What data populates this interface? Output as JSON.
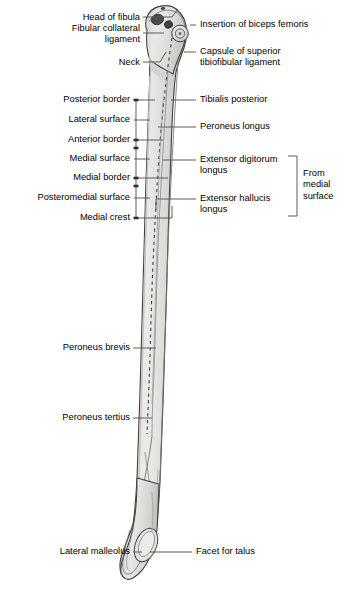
{
  "figure": {
    "title": "Fibula",
    "view": "lateral",
    "colors": {
      "background": "#ffffff",
      "bone_fill_light": "#e8e7e4",
      "bone_fill_mid": "#d6d5d2",
      "bone_fill_shadow": "#bfbebb",
      "bone_outline": "#3a3a3a",
      "marking_dark": "#4a4a4a",
      "leader_line": "#555555",
      "text": "#000000"
    }
  },
  "labels_left": [
    {
      "id": "head-of-fibula",
      "text": "Head of fibula",
      "x": 30,
      "y": 17,
      "width": 110
    },
    {
      "id": "fibular-collateral-ligament",
      "text": "Fibular collateral\nligament",
      "x": 18,
      "y": 28,
      "width": 122
    },
    {
      "id": "neck",
      "text": "Neck",
      "x": 70,
      "y": 58,
      "width": 70
    },
    {
      "id": "posterior-border",
      "text": "Posterior border",
      "x": 22,
      "y": 95,
      "width": 108
    },
    {
      "id": "lateral-surface",
      "text": "Lateral surface",
      "x": 26,
      "y": 115,
      "width": 104
    },
    {
      "id": "anterior-border",
      "text": "Anterior border",
      "x": 25,
      "y": 135,
      "width": 105
    },
    {
      "id": "medial-surface",
      "text": "Medial surface",
      "x": 26,
      "y": 155,
      "width": 104
    },
    {
      "id": "medial-border",
      "text": "Medial border",
      "x": 30,
      "y": 174,
      "width": 100
    },
    {
      "id": "posteromedial-surface",
      "text": "Posteromedial surface",
      "x": 5,
      "y": 193,
      "width": 125
    },
    {
      "id": "medial-crest",
      "text": "Medial crest",
      "x": 38,
      "y": 213,
      "width": 92
    },
    {
      "id": "peroneus-brevis",
      "text": "Peroneus brevis",
      "x": 24,
      "y": 343,
      "width": 106
    },
    {
      "id": "peroneus-tertius",
      "text": "Peroneus tertius",
      "x": 22,
      "y": 413,
      "width": 108
    },
    {
      "id": "lateral-malleolus",
      "text": "Lateral malleolus",
      "x": 20,
      "y": 546,
      "width": 110
    }
  ],
  "labels_right": [
    {
      "id": "insertion-of-biceps-femoris",
      "text": "Insertion of biceps femoris",
      "x": 200,
      "y": 20,
      "width": 142
    },
    {
      "id": "capsule-of-superior-tibiofibular-ligament",
      "text": "Capsule of superior\ntibiofibular ligament",
      "x": 200,
      "y": 46,
      "width": 140
    },
    {
      "id": "tibialis-posterior",
      "text": "Tibialis posterior",
      "x": 200,
      "y": 95,
      "width": 140
    },
    {
      "id": "peroneus-longus",
      "text": "Peroneus longus",
      "x": 200,
      "y": 122,
      "width": 140
    },
    {
      "id": "extensor-digitorum-longus",
      "text": "Extensor digitorum\nlongus",
      "x": 200,
      "y": 155,
      "width": 92
    },
    {
      "id": "extensor-hallucis-longus",
      "text": "Extensor hallucis\nlongus",
      "x": 200,
      "y": 194,
      "width": 92
    },
    {
      "id": "facet-for-talus",
      "text": "Facet for talus",
      "x": 196,
      "y": 546,
      "width": 140
    }
  ],
  "bracket_label": {
    "id": "from-medial-surface",
    "text": "From\nmedial\nsurface",
    "x": 303,
    "y": 168,
    "width": 40
  }
}
